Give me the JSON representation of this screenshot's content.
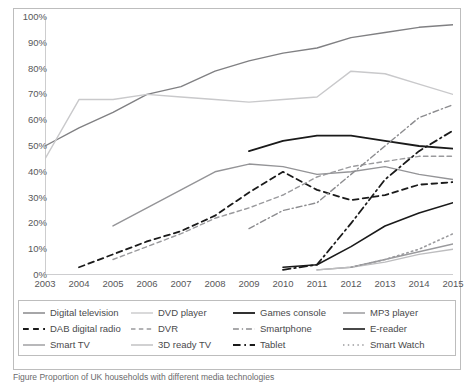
{
  "chart_data": {
    "type": "line",
    "title": "",
    "xlabel": "",
    "ylabel": "",
    "xlim": [
      2003,
      2015
    ],
    "ylim": [
      0,
      100
    ],
    "grid": false,
    "legend_position": "bottom",
    "categories": [
      2003,
      2004,
      2005,
      2006,
      2007,
      2008,
      2009,
      2010,
      2011,
      2012,
      2013,
      2014,
      2015
    ],
    "ytick_labels": [
      "0%",
      "10%",
      "20%",
      "30%",
      "40%",
      "50%",
      "60%",
      "70%",
      "80%",
      "90%",
      "100%"
    ],
    "ytick_values": [
      0,
      10,
      20,
      30,
      40,
      50,
      60,
      70,
      80,
      90,
      100
    ],
    "xtick_labels": [
      "2003",
      "2004",
      "2005",
      "2006",
      "2007",
      "2008",
      "2009",
      "2010",
      "2011",
      "2012",
      "2013",
      "2014",
      "2015"
    ],
    "series": [
      {
        "name": "Digital television",
        "style": "solid",
        "color": "#808083",
        "width": 1.4,
        "x": [
          2003,
          2004,
          2005,
          2006,
          2007,
          2008,
          2009,
          2010,
          2011,
          2012,
          2013,
          2014,
          2015
        ],
        "values": [
          50,
          57,
          63,
          70,
          73,
          79,
          83,
          86,
          88,
          92,
          94,
          96,
          97
        ]
      },
      {
        "name": "DVD player",
        "style": "solid",
        "color": "#c9c9cb",
        "width": 1.4,
        "x": [
          2003,
          2004,
          2005,
          2006,
          2007,
          2008,
          2009,
          2010,
          2011,
          2012,
          2013,
          2014,
          2015
        ],
        "values": [
          45,
          68,
          68,
          70,
          69,
          68,
          67,
          68,
          69,
          79,
          78,
          74,
          70
        ]
      },
      {
        "name": "Games console",
        "style": "solid",
        "color": "#1a1a1a",
        "width": 1.8,
        "x": [
          2009,
          2010,
          2011,
          2012,
          2013,
          2014,
          2015
        ],
        "values": [
          48,
          52,
          54,
          54,
          52,
          50,
          49
        ]
      },
      {
        "name": "MP3 player",
        "style": "solid",
        "color": "#949497",
        "width": 1.4,
        "x": [
          2005,
          2006,
          2007,
          2008,
          2009,
          2010,
          2011,
          2012,
          2013,
          2014,
          2015
        ],
        "values": [
          19,
          26,
          33,
          40,
          43,
          42,
          39,
          40,
          42,
          39,
          37
        ]
      },
      {
        "name": "DAB digital radio",
        "style": "dashed",
        "color": "#1a1a1a",
        "width": 1.8,
        "x": [
          2004,
          2005,
          2006,
          2007,
          2008,
          2009,
          2010,
          2011,
          2012,
          2013,
          2014,
          2015
        ],
        "values": [
          3,
          8,
          13,
          17,
          23,
          32,
          40,
          33,
          29,
          31,
          35,
          36
        ]
      },
      {
        "name": "DVR",
        "style": "dashed",
        "color": "#9a9a9d",
        "width": 1.4,
        "x": [
          2005,
          2006,
          2007,
          2008,
          2009,
          2010,
          2011,
          2012,
          2013,
          2014,
          2015
        ],
        "values": [
          6,
          11,
          16,
          22,
          26,
          31,
          38,
          42,
          44,
          46,
          46
        ]
      },
      {
        "name": "Smartphone",
        "style": "dashdot",
        "color": "#8c8c8f",
        "width": 1.4,
        "x": [
          2009,
          2010,
          2011,
          2012,
          2013,
          2014,
          2015
        ],
        "values": [
          18,
          25,
          28,
          39,
          50,
          61,
          66
        ]
      },
      {
        "name": "E-reader",
        "style": "solid",
        "color": "#1a1a1a",
        "width": 1.6,
        "x": [
          2010,
          2011,
          2012,
          2013,
          2014,
          2015
        ],
        "values": [
          3,
          4,
          11,
          19,
          24,
          28
        ]
      },
      {
        "name": "Smart TV",
        "style": "solid",
        "color": "#9a9a9d",
        "width": 1.4,
        "x": [
          2011,
          2012,
          2013,
          2014,
          2015
        ],
        "values": [
          2,
          3,
          6,
          9,
          12
        ]
      },
      {
        "name": "3D ready TV",
        "style": "solid",
        "color": "#bdbdbf",
        "width": 1.4,
        "x": [
          2011,
          2012,
          2013,
          2014,
          2015
        ],
        "values": [
          2,
          3,
          5,
          8,
          10
        ]
      },
      {
        "name": "Tablet",
        "style": "dashdot",
        "color": "#1a1a1a",
        "width": 1.8,
        "x": [
          2010,
          2011,
          2012,
          2013,
          2014,
          2015
        ],
        "values": [
          2,
          4,
          20,
          37,
          48,
          56
        ]
      },
      {
        "name": "Smart Watch",
        "style": "dotted",
        "color": "#9a9a9d",
        "width": 1.6,
        "x": [
          2012,
          2013,
          2014,
          2015
        ],
        "values": [
          3,
          6,
          10,
          16
        ]
      }
    ]
  },
  "legend": {
    "items": [
      {
        "label": "Digital television"
      },
      {
        "label": "DVD player"
      },
      {
        "label": "Games console"
      },
      {
        "label": "MP3 player"
      },
      {
        "label": "DAB digital radio"
      },
      {
        "label": "DVR"
      },
      {
        "label": "Smartphone"
      },
      {
        "label": "E-reader"
      },
      {
        "label": "Smart TV"
      },
      {
        "label": "3D ready TV"
      },
      {
        "label": "Tablet"
      },
      {
        "label": "Smart Watch"
      }
    ]
  },
  "caption": {
    "text": "Figure     Proportion of UK households with different media technologies"
  }
}
